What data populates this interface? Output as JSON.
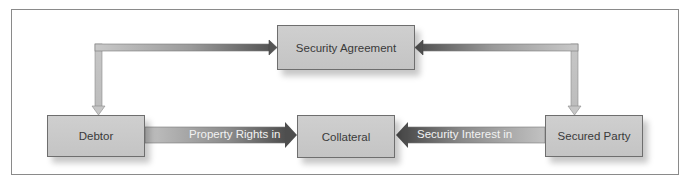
{
  "diagram": {
    "type": "secured-transaction-flow",
    "nodes": {
      "security_agreement": "Security Agreement",
      "debtor": "Debtor",
      "collateral": "Collateral",
      "secured_party": "Secured Party"
    },
    "edges": {
      "debtor_to_collateral": "Property Rights in",
      "secured_party_to_collateral": "Security Interest in",
      "debtor_agreement": "",
      "secured_party_agreement": ""
    },
    "colors": {
      "node_fill": "#c8c8c8",
      "node_border": "#6e6e6e",
      "arrow_dark": "#5a5a5a",
      "arrow_light": "#c4c4c4",
      "frame_border": "#8a8a8a"
    }
  }
}
